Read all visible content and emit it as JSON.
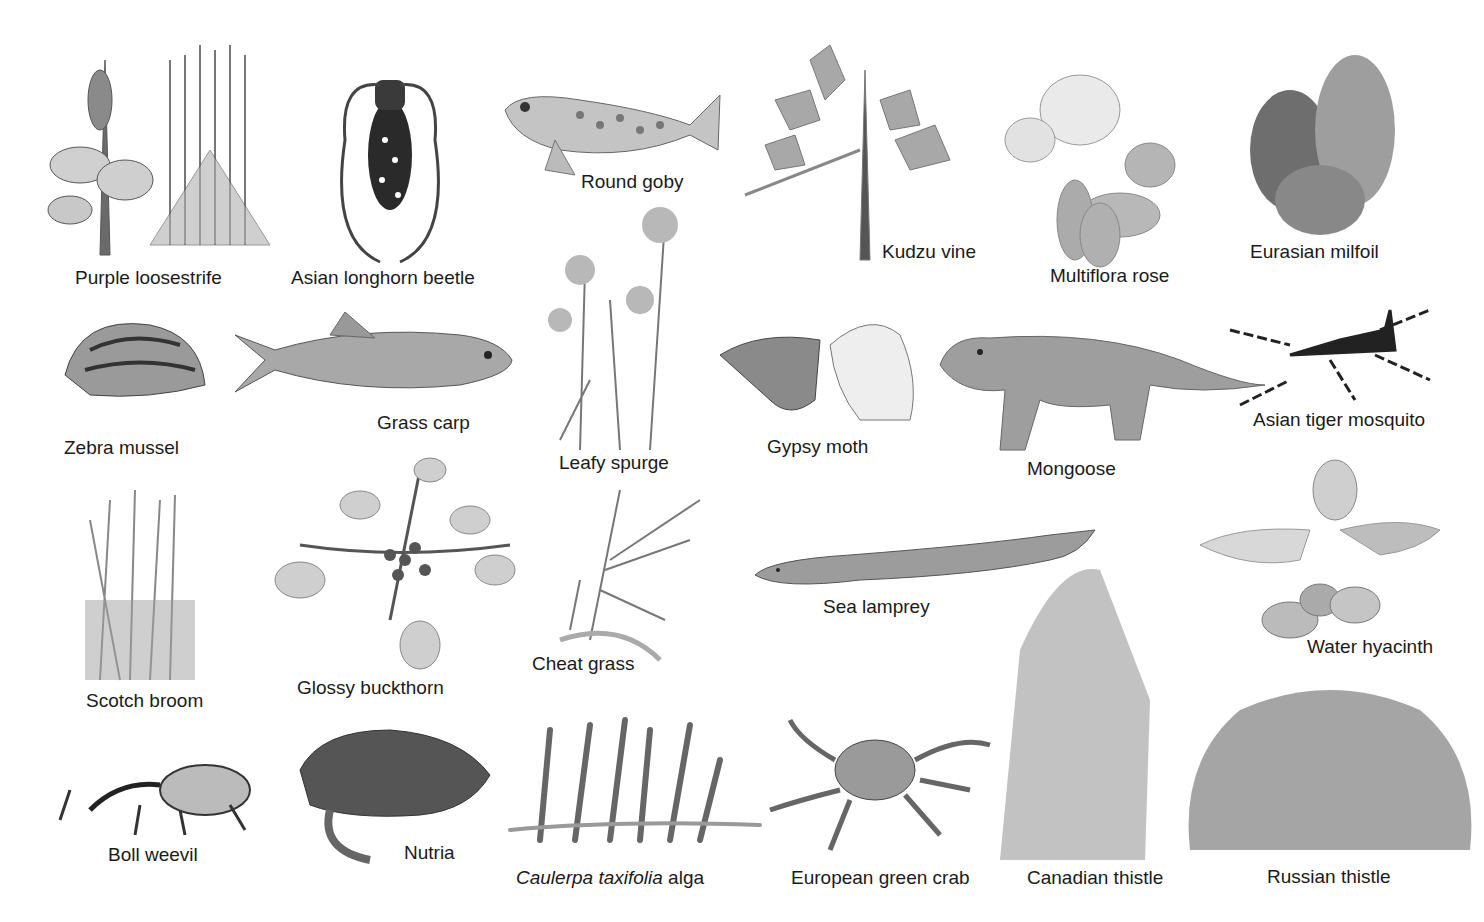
{
  "figure": {
    "palette": {
      "background": "#ffffff",
      "ink": "#1a1a1a",
      "dark": "#3a3a3a",
      "mid": "#7a7a7a",
      "light": "#b5b5b5",
      "pale": "#d8d8d8"
    },
    "species": [
      {
        "id": "purple-loosestrife",
        "label": "Purple loosestrife",
        "x": 75,
        "y": 268
      },
      {
        "id": "asian-longhorn-beetle",
        "label": "Asian longhorn beetle",
        "x": 291,
        "y": 268
      },
      {
        "id": "round-goby",
        "label": "Round goby",
        "x": 581,
        "y": 172
      },
      {
        "id": "kudzu-vine",
        "label": "Kudzu vine",
        "x": 882,
        "y": 242
      },
      {
        "id": "multiflora-rose",
        "label": "Multiflora rose",
        "x": 1050,
        "y": 266
      },
      {
        "id": "eurasian-milfoil",
        "label": "Eurasian milfoil",
        "x": 1250,
        "y": 242
      },
      {
        "id": "zebra-mussel",
        "label": "Zebra mussel",
        "x": 64,
        "y": 438
      },
      {
        "id": "grass-carp",
        "label": "Grass carp",
        "x": 377,
        "y": 413
      },
      {
        "id": "leafy-spurge",
        "label": "Leafy spurge",
        "x": 559,
        "y": 453
      },
      {
        "id": "gypsy-moth",
        "label": "Gypsy moth",
        "x": 767,
        "y": 437
      },
      {
        "id": "mongoose",
        "label": "Mongoose",
        "x": 1027,
        "y": 459
      },
      {
        "id": "asian-tiger-mosquito",
        "label": "Asian tiger mosquito",
        "x": 1253,
        "y": 410
      },
      {
        "id": "scotch-broom",
        "label": "Scotch broom",
        "x": 86,
        "y": 691
      },
      {
        "id": "glossy-buckthorn",
        "label": "Glossy buckthorn",
        "x": 297,
        "y": 678
      },
      {
        "id": "cheat-grass",
        "label": "Cheat grass",
        "x": 532,
        "y": 654
      },
      {
        "id": "sea-lamprey",
        "label": "Sea lamprey",
        "x": 823,
        "y": 597
      },
      {
        "id": "water-hyacinth",
        "label": "Water hyacinth",
        "x": 1307,
        "y": 637
      },
      {
        "id": "boll-weevil",
        "label": "Boll weevil",
        "x": 108,
        "y": 845
      },
      {
        "id": "nutria",
        "label": "Nutria",
        "x": 404,
        "y": 843
      },
      {
        "id": "caulerpa-taxifolia-alga",
        "label_italic": "Caulerpa taxifolia",
        "label_rest": " alga",
        "x": 516,
        "y": 868
      },
      {
        "id": "european-green-crab",
        "label": "European green crab",
        "x": 791,
        "y": 868
      },
      {
        "id": "canadian-thistle",
        "label": "Canadian thistle",
        "x": 1027,
        "y": 868
      },
      {
        "id": "russian-thistle",
        "label": "Russian thistle",
        "x": 1267,
        "y": 867
      }
    ]
  }
}
